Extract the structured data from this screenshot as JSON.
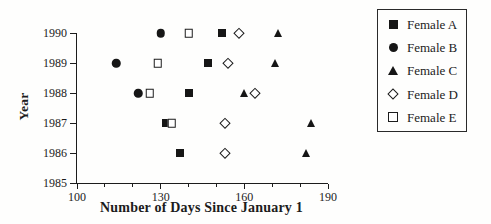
{
  "chart_data": {
    "type": "scatter",
    "title": "",
    "xlabel": "Number of Days Since January 1",
    "ylabel": "Year",
    "xlim": [
      100,
      190
    ],
    "ylim": [
      1985,
      1990
    ],
    "x_ticks_major": [
      100,
      130,
      160,
      190
    ],
    "x_ticks_minor_step": 10,
    "y_ticks": [
      1990,
      1989,
      1988,
      1987,
      1986,
      1985
    ],
    "grid": false,
    "legend_position": "outside-right",
    "marker_color": "#161616",
    "background_color": "#fefefd",
    "series": [
      {
        "name": "Female A",
        "marker": "filled-square",
        "points": [
          {
            "year": 1986,
            "day": 137
          },
          {
            "year": 1987,
            "day": 132
          },
          {
            "year": 1988,
            "day": 140
          },
          {
            "year": 1989,
            "day": 147
          },
          {
            "year": 1990,
            "day": 152
          }
        ]
      },
      {
        "name": "Female B",
        "marker": "filled-circle",
        "points": [
          {
            "year": 1988,
            "day": 122
          },
          {
            "year": 1989,
            "day": 114
          },
          {
            "year": 1990,
            "day": 130
          }
        ]
      },
      {
        "name": "Female C",
        "marker": "filled-triangle",
        "points": [
          {
            "year": 1986,
            "day": 182
          },
          {
            "year": 1987,
            "day": 184
          },
          {
            "year": 1988,
            "day": 160
          },
          {
            "year": 1989,
            "day": 171
          },
          {
            "year": 1990,
            "day": 172
          }
        ]
      },
      {
        "name": "Female D",
        "marker": "open-diamond",
        "points": [
          {
            "year": 1986,
            "day": 153
          },
          {
            "year": 1987,
            "day": 153
          },
          {
            "year": 1988,
            "day": 164
          },
          {
            "year": 1989,
            "day": 154
          },
          {
            "year": 1990,
            "day": 158
          }
        ]
      },
      {
        "name": "Female E",
        "marker": "open-square",
        "points": [
          {
            "year": 1987,
            "day": 134
          },
          {
            "year": 1988,
            "day": 126
          },
          {
            "year": 1989,
            "day": 129
          },
          {
            "year": 1990,
            "day": 140
          }
        ]
      }
    ]
  }
}
